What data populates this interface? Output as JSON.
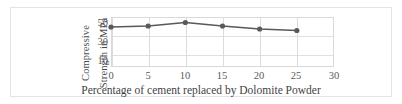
{
  "chart_data": {
    "type": "line",
    "title": "",
    "xlabel": "Percentage of cement replaced by Dolomite  Powder",
    "ylabel": "Compressive Strength in MPa",
    "ylabel_lines": [
      "Compressive",
      "Strength in  MPa"
    ],
    "x": [
      0,
      5,
      10,
      15,
      20,
      25
    ],
    "values": [
      40,
      41,
      44.5,
      41,
      38,
      36.5
    ],
    "xticks": [
      0,
      5,
      10,
      15,
      20,
      25,
      30
    ],
    "yticks": [
      10,
      30,
      50
    ],
    "xlim": [
      0,
      30
    ],
    "ylim": [
      0,
      50
    ],
    "grid": true,
    "legend": "none",
    "series": [
      {
        "name": "Compressive Strength",
        "values": [
          40,
          41,
          44.5,
          41,
          38,
          36.5
        ],
        "color": "#595959",
        "marker": "circle"
      }
    ]
  },
  "colors": {
    "line": "#595959",
    "marker": "#4d4d4d",
    "grid": "#e0e0e0",
    "axis_text": "#595959",
    "frame": "#e3e3e3",
    "background": "#ffffff"
  }
}
